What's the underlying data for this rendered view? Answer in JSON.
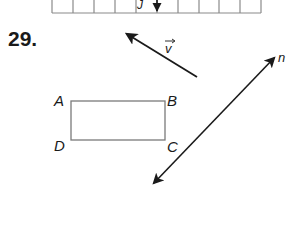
{
  "problem": {
    "number": "29."
  },
  "grid": {
    "columns": 10,
    "label": "J",
    "line_color": "#8a8a8a"
  },
  "vector": {
    "label": "v",
    "notation": "vector-arrow-overline"
  },
  "line": {
    "label": "n"
  },
  "rectangle": {
    "vertices": {
      "top_left": "A",
      "top_right": "B",
      "bottom_right": "C",
      "bottom_left": "D"
    },
    "edge_color": "#7a7a7a"
  },
  "colors": {
    "ink": "#1a1a1a",
    "background": "#ffffff"
  }
}
